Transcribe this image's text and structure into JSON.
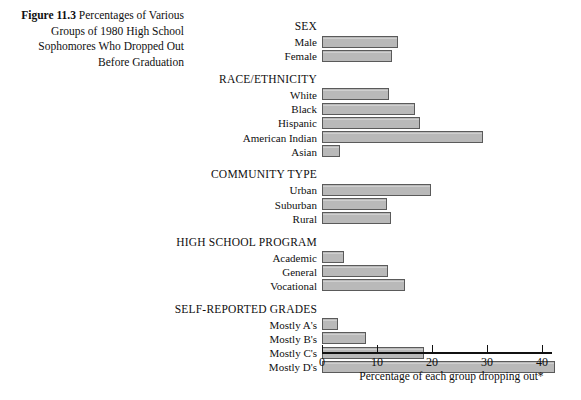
{
  "caption": {
    "figure_number": "Figure 11.3",
    "text": " Percentages of Various Groups of 1980 High School Sophomores Who Dropped Out Before Graduation"
  },
  "axis": {
    "x_title": "Percentage of each group dropping out*",
    "ticks": [
      "0",
      "10",
      "20",
      "30",
      "40"
    ]
  },
  "chart_data": {
    "type": "bar",
    "orientation": "horizontal",
    "title": "Figure 11.3 Percentages of Various Groups of 1980 High School Sophomores Who Dropped Out Before Graduation",
    "xlabel": "Percentage of each group dropping out*",
    "ylabel": "",
    "xlim": [
      0,
      42.5
    ],
    "xticks": [
      0,
      10,
      20,
      30,
      40
    ],
    "grid": false,
    "legend": null,
    "bar_color": "#b9b9b9",
    "bar_edge_color": "#5a5a5a",
    "groups": [
      {
        "name": "SEX",
        "categories": [
          "Male",
          "Female"
        ],
        "values": [
          13.8,
          12.7
        ]
      },
      {
        "name": "RACE/ETHNICITY",
        "categories": [
          "White",
          "Black",
          "Hispanic",
          "American Indian",
          "Asian"
        ],
        "values": [
          12.2,
          16.9,
          17.8,
          29.3,
          3.3
        ]
      },
      {
        "name": "COMMUNITY TYPE",
        "categories": [
          "Urban",
          "Suburban",
          "Rural"
        ],
        "values": [
          19.8,
          11.8,
          12.5
        ]
      },
      {
        "name": "HIGH SCHOOL PROGRAM",
        "categories": [
          "Academic",
          "General",
          "Vocational"
        ],
        "values": [
          4.0,
          12.0,
          15.0
        ]
      },
      {
        "name": "SELF-REPORTED GRADES",
        "categories": [
          "Mostly A's",
          "Mostly B's",
          "Mostly C's",
          "Mostly D's"
        ],
        "values": [
          2.9,
          8.0,
          18.5,
          42.4
        ]
      }
    ]
  }
}
